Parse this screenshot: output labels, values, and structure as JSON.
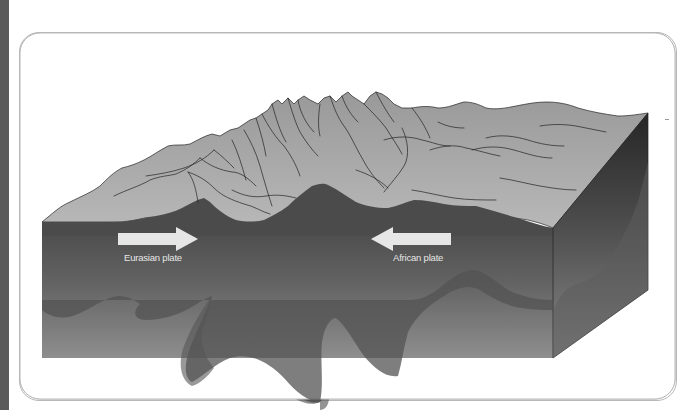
{
  "figure": {
    "labels": {
      "left_plate": "Eurasian plate",
      "right_plate": "African plate"
    },
    "arrows": [
      {
        "name": "eurasian-plate-arrow",
        "direction": "right"
      },
      {
        "name": "african-plate-arrow",
        "direction": "left"
      }
    ],
    "colors": {
      "side_bar": "#5a5a5a",
      "panel_border": "#b8b8b8",
      "mountain_top": "#a8a8a8",
      "block_front_top": "#595959",
      "block_front_bottom": "#8c8c8c",
      "block_side_top": "#3a3a3a",
      "block_side_bottom": "#7e7e7e",
      "crust_root": "#4f4f4f",
      "arrow_fill": "#e8e8e8",
      "label_text": "#e6e6e6",
      "outline": "#222222"
    }
  }
}
